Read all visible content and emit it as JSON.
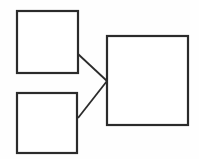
{
  "diagram": {
    "type": "block-diagram",
    "title": "",
    "canvas": {
      "width": 199,
      "height": 159,
      "background": "#fefefe"
    },
    "style": {
      "stroke_color": "#2b2b2b",
      "node_stroke_width": 2.2,
      "connector_stroke_width": 1.8,
      "node_fill": "#ffffff"
    },
    "nodes": [
      {
        "id": "node-top-left",
        "name": "top-left-box",
        "label": "",
        "x": 17,
        "y": 11,
        "width": 61,
        "height": 62
      },
      {
        "id": "node-bottom-left",
        "name": "bottom-left-box",
        "label": "",
        "x": 17,
        "y": 93,
        "width": 60,
        "height": 60
      },
      {
        "id": "node-right",
        "name": "right-box",
        "label": "",
        "x": 107,
        "y": 36,
        "width": 81,
        "height": 89
      }
    ],
    "connectors": [
      {
        "id": "connector-top",
        "name": "top-left-to-right-connector",
        "from": "node-top-left",
        "to": "node-right",
        "x1": 78,
        "y1": 54,
        "x2": 107,
        "y2": 81
      },
      {
        "id": "connector-bottom",
        "name": "bottom-left-to-right-connector",
        "from": "node-bottom-left",
        "to": "node-right",
        "x1": 78,
        "y1": 118,
        "x2": 107,
        "y2": 81
      }
    ]
  }
}
